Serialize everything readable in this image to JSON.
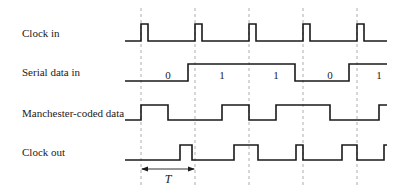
{
  "diagram": {
    "signals": [
      {
        "id": "clock_in",
        "label": "Clock in",
        "label_y": 28,
        "high_y": 24,
        "low_y": 41,
        "path": [
          [
            125,
            "L"
          ],
          [
            141,
            "H"
          ],
          [
            148,
            "L"
          ],
          [
            195,
            "H"
          ],
          [
            202,
            "L"
          ],
          [
            249,
            "H"
          ],
          [
            256,
            "L"
          ],
          [
            303,
            "H"
          ],
          [
            310,
            "L"
          ],
          [
            357,
            "H"
          ],
          [
            364,
            "L"
          ],
          [
            387,
            "L"
          ]
        ]
      },
      {
        "id": "serial_data_in",
        "label": "Serial data in",
        "label_y": 67,
        "high_y": 64,
        "low_y": 81,
        "path": [
          [
            125,
            "L"
          ],
          [
            188,
            "H"
          ],
          [
            295,
            "L"
          ],
          [
            349,
            "H"
          ],
          [
            387,
            "H"
          ]
        ]
      },
      {
        "id": "manchester_coded_data",
        "label": "Manchester-coded data",
        "label_y": 108,
        "high_y": 105,
        "low_y": 120,
        "path": [
          [
            125,
            "L"
          ],
          [
            141,
            "H"
          ],
          [
            168,
            "L"
          ],
          [
            222,
            "H"
          ],
          [
            249,
            "L"
          ],
          [
            276,
            "H"
          ],
          [
            330,
            "L"
          ],
          [
            379,
            "H"
          ],
          [
            387,
            "H"
          ]
        ]
      },
      {
        "id": "clock_out",
        "label": "Clock out",
        "label_y": 147,
        "high_y": 145,
        "low_y": 160,
        "path": [
          [
            125,
            "L"
          ],
          [
            180,
            "H"
          ],
          [
            192,
            "L"
          ],
          [
            234,
            "H"
          ],
          [
            258,
            "L"
          ],
          [
            296,
            "H"
          ],
          [
            303,
            "L"
          ],
          [
            342,
            "H"
          ],
          [
            357,
            "L"
          ],
          [
            384,
            "H"
          ],
          [
            387,
            "H"
          ]
        ]
      }
    ],
    "bits": [
      {
        "value": "0",
        "x": 168,
        "y": 70
      },
      {
        "value": "1",
        "x": 222,
        "y": 70
      },
      {
        "value": "1",
        "x": 276,
        "y": 70
      },
      {
        "value": "0",
        "x": 330,
        "y": 70
      },
      {
        "value": "1",
        "x": 379,
        "y": 70
      }
    ],
    "clock_edges_x": [
      141,
      195,
      249,
      303,
      357
    ],
    "period": {
      "label": "T",
      "x1": 141,
      "x2": 195,
      "arrow_y": 169,
      "label_y": 173
    },
    "colors": {
      "line": "#1a1a1a",
      "dashed": "#9a9a9a"
    }
  }
}
